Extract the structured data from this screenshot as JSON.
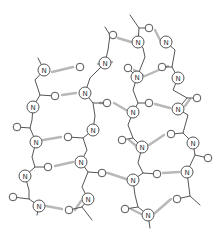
{
  "diagram": {
    "title": "",
    "colors": {
      "bond": "#555555",
      "hbond": "#b8b8b8",
      "atom_fill": "#ffffff",
      "label": "#333333"
    },
    "atom_label": "N",
    "nitrogens": [
      [
        44,
        70
      ],
      [
        33,
        107
      ],
      [
        36,
        142
      ],
      [
        25,
        176
      ],
      [
        39,
        206
      ],
      [
        85,
        93
      ],
      [
        93,
        130
      ],
      [
        81,
        162
      ],
      [
        88,
        199
      ],
      [
        105,
        63
      ],
      [
        138,
        42
      ],
      [
        137,
        77
      ],
      [
        133,
        112
      ],
      [
        142,
        147
      ],
      [
        133,
        180
      ],
      [
        148,
        215
      ],
      [
        166,
        42
      ],
      [
        178,
        78
      ],
      [
        178,
        109
      ],
      [
        193,
        143
      ],
      [
        187,
        172
      ]
    ],
    "oxygens": [
      [
        80,
        67
      ],
      [
        55,
        96
      ],
      [
        17,
        127
      ],
      [
        48,
        167
      ],
      [
        13,
        197
      ],
      [
        107,
        103
      ],
      [
        68,
        137
      ],
      [
        102,
        173
      ],
      [
        69,
        210
      ],
      [
        113,
        35
      ],
      [
        128,
        68
      ],
      [
        149,
        28
      ],
      [
        149,
        103
      ],
      [
        122,
        140
      ],
      [
        157,
        174
      ],
      [
        125,
        209
      ],
      [
        162,
        67
      ],
      [
        197,
        98
      ],
      [
        171,
        134
      ],
      [
        208,
        158
      ],
      [
        177,
        199
      ]
    ],
    "bonds": [
      [
        [
          38,
          58
        ],
        [
          44,
          70
        ]
      ],
      [
        [
          44,
          70
        ],
        [
          35,
          80
        ],
        [
          40,
          95
        ],
        [
          33,
          107
        ]
      ],
      [
        [
          40,
          95
        ],
        [
          55,
          96
        ]
      ],
      [
        [
          33,
          107
        ],
        [
          32,
          120
        ],
        [
          30,
          128
        ],
        [
          36,
          142
        ]
      ],
      [
        [
          30,
          128
        ],
        [
          17,
          127
        ]
      ],
      [
        [
          36,
          142
        ],
        [
          32,
          157
        ],
        [
          35,
          167
        ],
        [
          25,
          176
        ]
      ],
      [
        [
          35,
          167
        ],
        [
          48,
          167
        ]
      ],
      [
        [
          25,
          176
        ],
        [
          29,
          190
        ],
        [
          29,
          199
        ],
        [
          39,
          206
        ]
      ],
      [
        [
          29,
          199
        ],
        [
          13,
          197
        ]
      ],
      [
        [
          39,
          206
        ],
        [
          37,
          215
        ]
      ],
      [
        [
          105,
          63
        ],
        [
          108,
          50
        ],
        [
          110,
          35
        ],
        [
          105,
          27
        ]
      ],
      [
        [
          110,
          35
        ],
        [
          113,
          35
        ]
      ],
      [
        [
          105,
          63
        ],
        [
          90,
          78
        ],
        [
          85,
          93
        ]
      ],
      [
        [
          85,
          93
        ],
        [
          93,
          103
        ],
        [
          107,
          103
        ]
      ],
      [
        [
          93,
          103
        ],
        [
          95,
          116
        ],
        [
          93,
          130
        ]
      ],
      [
        [
          93,
          130
        ],
        [
          83,
          138
        ],
        [
          68,
          137
        ]
      ],
      [
        [
          83,
          138
        ],
        [
          87,
          150
        ],
        [
          81,
          162
        ]
      ],
      [
        [
          81,
          162
        ],
        [
          88,
          172
        ],
        [
          102,
          173
        ]
      ],
      [
        [
          88,
          172
        ],
        [
          82,
          187
        ],
        [
          88,
          199
        ]
      ],
      [
        [
          88,
          199
        ],
        [
          82,
          207
        ],
        [
          69,
          210
        ]
      ],
      [
        [
          82,
          207
        ],
        [
          92,
          220
        ]
      ],
      [
        [
          130,
          15
        ],
        [
          139,
          28
        ],
        [
          149,
          28
        ]
      ],
      [
        [
          139,
          28
        ],
        [
          138,
          42
        ]
      ],
      [
        [
          138,
          42
        ],
        [
          143,
          48
        ],
        [
          145,
          57
        ],
        [
          137,
          77
        ]
      ],
      [
        [
          137,
          77
        ],
        [
          128,
          68
        ]
      ],
      [
        [
          137,
          77
        ],
        [
          133,
          90
        ],
        [
          138,
          103
        ],
        [
          149,
          103
        ]
      ],
      [
        [
          138,
          103
        ],
        [
          133,
          112
        ]
      ],
      [
        [
          133,
          112
        ],
        [
          128,
          125
        ],
        [
          133,
          138
        ],
        [
          122,
          140
        ]
      ],
      [
        [
          133,
          138
        ],
        [
          142,
          147
        ]
      ],
      [
        [
          142,
          147
        ],
        [
          138,
          163
        ],
        [
          143,
          173
        ],
        [
          157,
          174
        ]
      ],
      [
        [
          143,
          173
        ],
        [
          133,
          180
        ]
      ],
      [
        [
          133,
          180
        ],
        [
          135,
          195
        ],
        [
          138,
          207
        ],
        [
          125,
          209
        ]
      ],
      [
        [
          138,
          207
        ],
        [
          148,
          215
        ]
      ],
      [
        [
          148,
          215
        ],
        [
          150,
          228
        ]
      ],
      [
        [
          166,
          42
        ],
        [
          175,
          50
        ],
        [
          172,
          67
        ],
        [
          162,
          67
        ]
      ],
      [
        [
          172,
          67
        ],
        [
          178,
          78
        ]
      ],
      [
        [
          178,
          78
        ],
        [
          173,
          90
        ],
        [
          187,
          98
        ],
        [
          197,
          98
        ]
      ],
      [
        [
          187,
          98
        ],
        [
          178,
          109
        ]
      ],
      [
        [
          178,
          109
        ],
        [
          188,
          115
        ],
        [
          183,
          133
        ],
        [
          171,
          134
        ]
      ],
      [
        [
          183,
          133
        ],
        [
          193,
          143
        ]
      ],
      [
        [
          193,
          143
        ],
        [
          195,
          155
        ],
        [
          208,
          158
        ]
      ],
      [
        [
          195,
          155
        ],
        [
          187,
          172
        ]
      ],
      [
        [
          187,
          172
        ],
        [
          190,
          196
        ],
        [
          177,
          199
        ]
      ],
      [
        [
          190,
          196
        ],
        [
          200,
          205
        ]
      ]
    ],
    "hbonds": [
      [
        [
          52,
          72
        ],
        [
          73,
          67
        ]
      ],
      [
        [
          62,
          95
        ],
        [
          76,
          93
        ]
      ],
      [
        [
          43,
          140
        ],
        [
          61,
          137
        ]
      ],
      [
        [
          55,
          166
        ],
        [
          73,
          162
        ]
      ],
      [
        [
          46,
          206
        ],
        [
          62,
          209
        ]
      ],
      [
        [
          118,
          38
        ],
        [
          131,
          42
        ]
      ],
      [
        [
          112,
          62
        ],
        [
          98,
          64
        ]
      ],
      [
        [
          134,
          70
        ],
        [
          144,
          76
        ]
      ],
      [
        [
          114,
          103
        ],
        [
          126,
          110
        ]
      ],
      [
        [
          155,
          30
        ],
        [
          160,
          40
        ]
      ],
      [
        [
          168,
          66
        ],
        [
          145,
          76
        ]
      ],
      [
        [
          155,
          104
        ],
        [
          170,
          108
        ]
      ],
      [
        [
          190,
          99
        ],
        [
          185,
          106
        ]
      ],
      [
        [
          129,
          140
        ],
        [
          135,
          145
        ]
      ],
      [
        [
          164,
          135
        ],
        [
          149,
          145
        ]
      ],
      [
        [
          108,
          173
        ],
        [
          126,
          179
        ]
      ],
      [
        [
          163,
          173
        ],
        [
          179,
          172
        ]
      ],
      [
        [
          131,
          209
        ],
        [
          141,
          214
        ]
      ],
      [
        [
          171,
          199
        ],
        [
          155,
          213
        ]
      ],
      [
        [
          75,
          210
        ],
        [
          81,
          201
        ]
      ],
      [
        [
          107,
          173
        ],
        [
          100,
          173
        ]
      ],
      [
        [
          108,
          103
        ],
        [
          100,
          103
        ]
      ]
    ]
  }
}
